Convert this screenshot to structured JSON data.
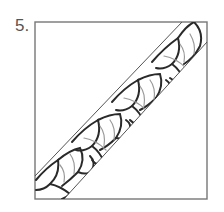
{
  "figure": {
    "number_label": "5.",
    "colors": {
      "frame": "#777777",
      "band_edge": "#555555",
      "motif_outline": "#2a2a2a",
      "motif_inner": "#9a9a9a",
      "background": "#ffffff"
    },
    "frame": {
      "x": 35,
      "y": 22,
      "width": 172,
      "height": 177
    },
    "band": {
      "upper_edge": [
        [
          35,
          176
        ],
        [
          182,
          22
        ]
      ],
      "lower_edge": [
        [
          64,
          199
        ],
        [
          207,
          42
        ]
      ]
    },
    "motif": "curved pinwheel segments repeating along diagonal band",
    "motif_count": 4
  }
}
